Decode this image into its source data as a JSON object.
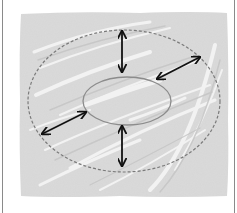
{
  "diagram": {
    "type": "concentric-ellipse-expansion",
    "colors": {
      "background": "#ffffff",
      "frame": "#8a8a8a",
      "texture_fill": "#d6d6d6",
      "texture_highlight": "#f4f4f4",
      "texture_shadow": "#c4c4c4",
      "outer_ellipse": "#7a7a7a",
      "inner_ellipse": "#8c8c8c",
      "arrows": "#111111"
    },
    "texture_panel": {
      "x": 20,
      "y": 12,
      "width": 208,
      "height": 185
    },
    "outer_ellipse": {
      "cx": 124,
      "cy": 101,
      "rx": 96,
      "ry": 71,
      "style": "dashed"
    },
    "inner_ellipse": {
      "cx": 127,
      "cy": 101,
      "rx": 44,
      "ry": 24,
      "style": "solid"
    },
    "arrows": [
      {
        "name": "top",
        "x1": 122,
        "y1": 31,
        "x2": 122,
        "y2": 72
      },
      {
        "name": "upper-right",
        "x1": 200,
        "y1": 57,
        "x2": 157,
        "y2": 79
      },
      {
        "name": "left",
        "x1": 42,
        "y1": 134,
        "x2": 86,
        "y2": 112
      },
      {
        "name": "bottom",
        "x1": 122,
        "y1": 126,
        "x2": 122,
        "y2": 166
      }
    ]
  }
}
